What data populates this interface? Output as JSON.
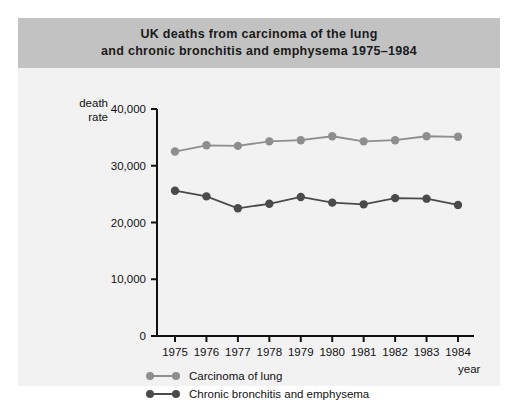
{
  "figure": {
    "title_lines": [
      "UK deaths from carcinoma of the lung",
      "and chronic bronchitis and emphysema 1975–1984"
    ],
    "y_axis_label_line1": "death",
    "y_axis_label_line2": "rate",
    "x_axis_label": "year",
    "banner_color": "#c2c2c2",
    "background_color": "#f2f2f2"
  },
  "legend": {
    "items": [
      {
        "label": "Carcinoma of lung",
        "color": "#8e8e8e"
      },
      {
        "label": "Chronic bronchitis and emphysema",
        "color": "#4a4a4a"
      }
    ]
  },
  "chart_data": {
    "type": "line",
    "title": "UK deaths from carcinoma of the lung and chronic bronchitis and emphysema 1975–1984",
    "xlabel": "year",
    "ylabel": "death rate",
    "categories": [
      "1975",
      "1976",
      "1977",
      "1978",
      "1979",
      "1980",
      "1981",
      "1982",
      "1983",
      "1984"
    ],
    "x": [
      1975,
      1976,
      1977,
      1978,
      1979,
      1980,
      1981,
      1982,
      1983,
      1984
    ],
    "ylim": [
      0,
      40000
    ],
    "yticks": [
      0,
      10000,
      20000,
      30000,
      40000
    ],
    "ytick_labels": [
      "0",
      "10,000",
      "20,000",
      "30,000",
      "40,000"
    ],
    "grid": false,
    "legend_position": "bottom-left",
    "series": [
      {
        "name": "Carcinoma of lung",
        "color": "#8e8e8e",
        "values": [
          32500,
          33600,
          33500,
          34300,
          34500,
          35200,
          34300,
          34500,
          35200,
          35100
        ]
      },
      {
        "name": "Chronic bronchitis and emphysema",
        "color": "#4a4a4a",
        "values": [
          25600,
          24600,
          22500,
          23300,
          24500,
          23500,
          23200,
          24300,
          24200,
          23100
        ]
      }
    ]
  }
}
